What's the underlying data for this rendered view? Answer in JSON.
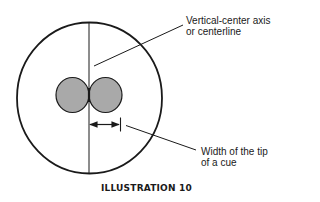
{
  "diagram": {
    "caption": "ILLUSTRATION 10",
    "labels": {
      "axis": {
        "line1": "Vertical-center axis",
        "line2": "or centerline"
      },
      "tip_width": {
        "line1": "Width of the tip",
        "line2": "of a cue"
      }
    },
    "colors": {
      "stroke": "#1a1a1a",
      "ball_fill": "#a9a9a9",
      "background": "#ffffff"
    }
  }
}
